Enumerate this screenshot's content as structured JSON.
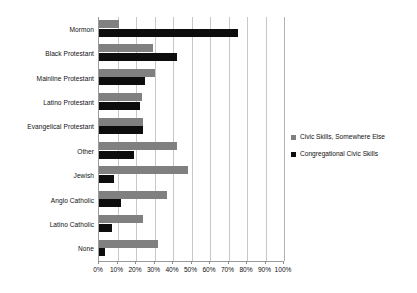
{
  "chart_data": {
    "type": "bar",
    "orientation": "horizontal",
    "title": "",
    "subtitle": "",
    "xlabel": "",
    "ylabel": "",
    "xlim": [
      0,
      100
    ],
    "x_tick_labels": [
      "0%",
      "10%",
      "20%",
      "30%",
      "40%",
      "50%",
      "60%",
      "70%",
      "80%",
      "90%",
      "100%"
    ],
    "x_tick_values": [
      0,
      10,
      20,
      30,
      40,
      50,
      60,
      70,
      80,
      90,
      100
    ],
    "grid": "vertical",
    "legend_position": "right",
    "categories": [
      "Mormon",
      "Black Protestant",
      "Mainline Protestant",
      "Latino Protestant",
      "Evangelical Protestant",
      "Other",
      "Jewish",
      "Anglo Catholic",
      "Latino Catholic",
      "None"
    ],
    "series": [
      {
        "name": "Civic Skills, Somewhere Else",
        "color": "#808080",
        "values": [
          11,
          29,
          30,
          23,
          24,
          42,
          48,
          37,
          24,
          32
        ]
      },
      {
        "name": "Congregational Civic Skills",
        "color": "#0d0d0d",
        "values": [
          75,
          42,
          25,
          22,
          24,
          19,
          8,
          12,
          7,
          3
        ]
      }
    ]
  },
  "legend": {
    "items": [
      {
        "label": "Civic Skills, Somewhere Else",
        "color": "#808080",
        "marker": "square-marker-gray"
      },
      {
        "label": "Congregational Civic Skills",
        "color": "#0d0d0d",
        "marker": "square-marker-black"
      }
    ]
  },
  "axis_colors": {
    "gridline": "#c8c8c8",
    "axis_line": "#9a9a9a",
    "text": "#111111"
  }
}
